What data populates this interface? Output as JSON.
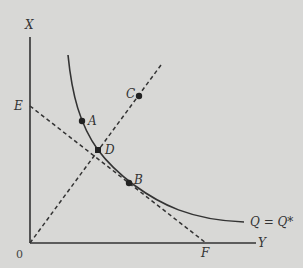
{
  "diagram": {
    "axes": {
      "vertical_label": "X",
      "horizontal_label": "Y",
      "origin_label": "0"
    },
    "curve_label": "Q = Q*",
    "points": {
      "A": "A",
      "B": "B",
      "C": "C",
      "D": "D"
    },
    "line_endpoints": {
      "E": "E",
      "F": "F"
    },
    "colors": {
      "background": "#d8d8d6",
      "ink": "#333333"
    }
  }
}
